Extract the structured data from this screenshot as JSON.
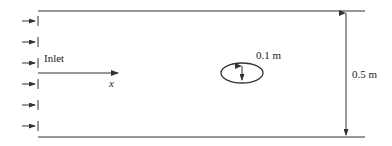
{
  "diagram": {
    "type": "flow-channel-schematic",
    "inlet_label": "Inlet",
    "axis_label": "x",
    "obstacle": {
      "shape": "ellipse",
      "dimension_label": "0.1 m"
    },
    "channel_height_label": "0.5 m",
    "inlet_arrow_count": 6,
    "colors": {
      "line": "#333333",
      "text": "#222222",
      "background": "#ffffff"
    }
  }
}
